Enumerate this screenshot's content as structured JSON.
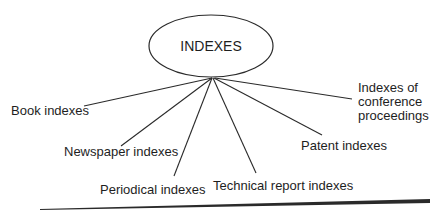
{
  "diagram": {
    "root": {
      "label": "INDEXES"
    },
    "children": [
      {
        "label": "Book indexes"
      },
      {
        "label": "Newspaper indexes"
      },
      {
        "label": "Periodical indexes"
      },
      {
        "label": "Technical report indexes"
      },
      {
        "label": "Patent indexes"
      },
      {
        "label_lines": [
          "Indexes of",
          "conference",
          "proceedings"
        ]
      }
    ]
  }
}
